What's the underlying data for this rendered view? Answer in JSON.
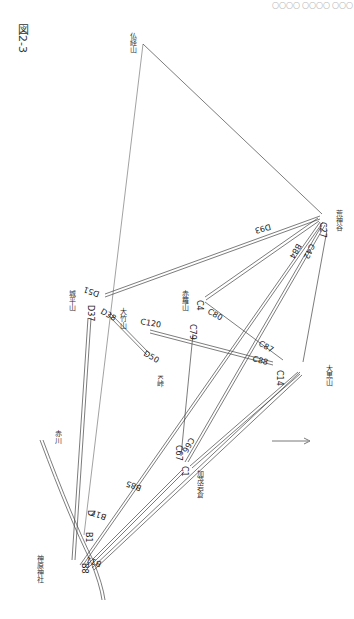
{
  "figure": {
    "title": "図2-3",
    "header_text": "〇〇〇〇 〇〇〇〇 〇〇〇"
  },
  "places": [
    {
      "id": "busshozan",
      "label": "仏経山",
      "x": 128,
      "y": 32
    },
    {
      "id": "arakamidani",
      "label": "荒神谷",
      "x": 334,
      "y": 210
    },
    {
      "id": "akabaneyama",
      "label": "赤羅山",
      "x": 180,
      "y": 290
    },
    {
      "id": "jonohirayama",
      "label": "城平山",
      "x": 67,
      "y": 290
    },
    {
      "id": "otakeyama",
      "label": "大竹山",
      "x": 118,
      "y": 308
    },
    {
      "id": "k-toge",
      "label": "K峠",
      "x": 155,
      "y": 375
    },
    {
      "id": "oguroyama",
      "label": "大黒山",
      "x": 324,
      "y": 365
    },
    {
      "id": "kamoiwakura",
      "label": "加茂岩倉",
      "x": 195,
      "y": 470
    },
    {
      "id": "akagawa",
      "label": "赤川",
      "x": 53,
      "y": 430
    },
    {
      "id": "kanbara-jinja",
      "label": "神原神社",
      "x": 35,
      "y": 555
    }
  ],
  "codes": [
    {
      "label": "C27",
      "x": 320,
      "y": 222,
      "rot": 90
    },
    {
      "label": "D93",
      "x": 270,
      "y": 224,
      "rot": 165
    },
    {
      "label": "B84",
      "x": 297,
      "y": 243,
      "rot": 120
    },
    {
      "label": "C42",
      "x": 310,
      "y": 243,
      "rot": 115
    },
    {
      "label": "C4",
      "x": 197,
      "y": 300,
      "rot": 90
    },
    {
      "label": "C80",
      "x": 207,
      "y": 313,
      "rot": 30
    },
    {
      "label": "C79",
      "x": 190,
      "y": 324,
      "rot": 90
    },
    {
      "label": "C87",
      "x": 258,
      "y": 345,
      "rot": 30
    },
    {
      "label": "C88",
      "x": 252,
      "y": 361,
      "rot": 15
    },
    {
      "label": "C14",
      "x": 277,
      "y": 370,
      "rot": 90
    },
    {
      "label": "D51",
      "x": 100,
      "y": 292,
      "rot": 200
    },
    {
      "label": "D37",
      "x": 88,
      "y": 305,
      "rot": 90
    },
    {
      "label": "D38",
      "x": 100,
      "y": 313,
      "rot": 30
    },
    {
      "label": "C120",
      "x": 140,
      "y": 324,
      "rot": 10
    },
    {
      "label": "D50",
      "x": 143,
      "y": 355,
      "rot": 30
    },
    {
      "label": "C66",
      "x": 190,
      "y": 437,
      "rot": 120
    },
    {
      "label": "C67",
      "x": 176,
      "y": 445,
      "rot": 90
    },
    {
      "label": "C1",
      "x": 182,
      "y": 466,
      "rot": 90
    },
    {
      "label": "B85",
      "x": 142,
      "y": 486,
      "rot": 200
    },
    {
      "label": "B17",
      "x": 107,
      "y": 515,
      "rot": 200
    },
    {
      "label": "D",
      "x": 88,
      "y": 510,
      "rot": 90
    },
    {
      "label": "B1",
      "x": 86,
      "y": 532,
      "rot": 90
    },
    {
      "label": "B11",
      "x": 102,
      "y": 562,
      "rot": 200
    },
    {
      "label": "B8",
      "x": 82,
      "y": 563,
      "rot": 90
    }
  ],
  "north_arrow": {
    "label": "N",
    "x1": 272,
    "y1": 441,
    "x2": 308,
    "y2": 441
  }
}
